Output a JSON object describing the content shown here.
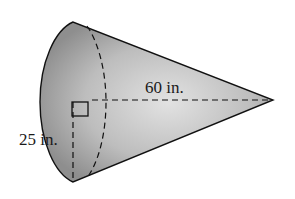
{
  "figure": {
    "shape": "cone",
    "labels": {
      "slant_or_height": "60 in.",
      "radius": "25 in."
    },
    "colors": {
      "fill_light": "#dcdcdc",
      "fill_dark": "#8a8a8a",
      "stroke": "#111111"
    },
    "markers": [
      "right-angle-marker"
    ]
  }
}
